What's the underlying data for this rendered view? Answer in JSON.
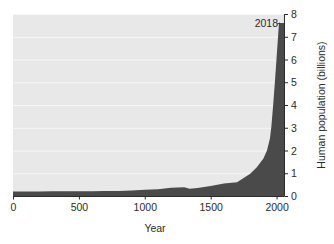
{
  "chart_data": {
    "type": "area",
    "title": "",
    "xlabel": "Year",
    "ylabel": "Human population (billions)",
    "xlim": [
      0,
      2060
    ],
    "ylim": [
      0,
      8
    ],
    "xticks": [
      0,
      500,
      1000,
      1500,
      2000
    ],
    "xtick_labels": [
      "0",
      "500",
      "1000",
      "1500",
      "2000"
    ],
    "yticks": [
      0,
      1,
      2,
      3,
      4,
      5,
      6,
      7,
      8
    ],
    "ytick_labels": [
      "0",
      "1",
      "2",
      "3",
      "4",
      "5",
      "6",
      "7",
      "8"
    ],
    "y_axis_position": "right",
    "grid": true,
    "grid_orientation": "horizontal",
    "legend": null,
    "plot_background": "#e8e8e8",
    "grid_color": "#f7f7f7",
    "area_color": "#4a4a4a",
    "figure_background": "#ffffff",
    "annotations": [
      {
        "text": "2018",
        "x": 2018,
        "y": 7.6,
        "leader_line": true
      }
    ],
    "x": [
      0,
      100,
      200,
      300,
      400,
      500,
      600,
      700,
      800,
      900,
      1000,
      1100,
      1200,
      1300,
      1340,
      1400,
      1500,
      1600,
      1700,
      1750,
      1800,
      1850,
      1900,
      1927,
      1950,
      1960,
      1974,
      1987,
      1999,
      2011,
      2018,
      2025,
      2040,
      2060
    ],
    "values": [
      0.2,
      0.2,
      0.2,
      0.21,
      0.21,
      0.21,
      0.21,
      0.22,
      0.22,
      0.24,
      0.27,
      0.3,
      0.36,
      0.39,
      0.32,
      0.35,
      0.44,
      0.55,
      0.6,
      0.79,
      0.98,
      1.26,
      1.65,
      2.0,
      2.54,
      3.03,
      4.0,
      5.0,
      6.0,
      7.0,
      7.6,
      7.6,
      7.6,
      7.6
    ]
  },
  "axes": {
    "xlabel": "Year",
    "ylabel": "Human population (billions)"
  },
  "annotation": {
    "label": "2018"
  }
}
